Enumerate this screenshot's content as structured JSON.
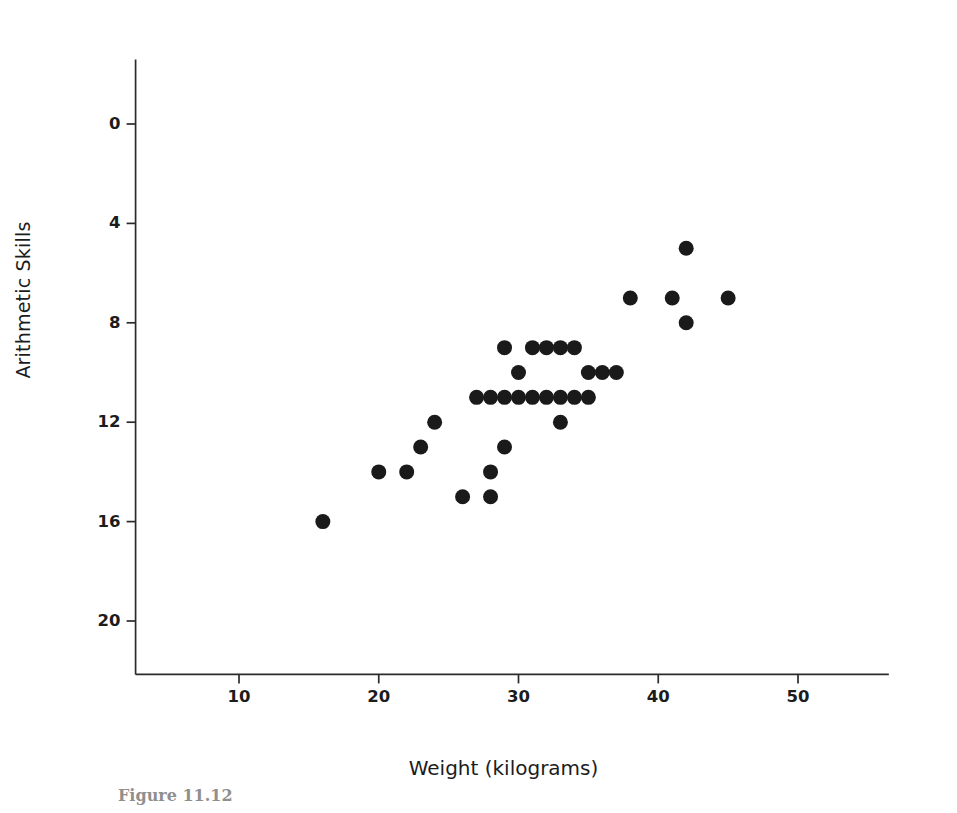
{
  "figure": {
    "caption": "Figure 11.12"
  },
  "chart_data": {
    "type": "scatter",
    "title": "",
    "xlabel": "Weight (kilograms)",
    "ylabel": "Arithmetic Skills",
    "xlim": [
      0,
      57
    ],
    "ylim": [
      -4,
      23
    ],
    "grid": false,
    "legend": "none",
    "xticks": [
      10,
      20,
      30,
      40,
      50
    ],
    "yticks": [
      0,
      4,
      8,
      12,
      16,
      20
    ],
    "marker": {
      "shape": "circle",
      "color": "#1a1a1a",
      "size_px": 15
    },
    "points": [
      {
        "x": 16,
        "y": 4
      },
      {
        "x": 20,
        "y": 6
      },
      {
        "x": 22,
        "y": 6
      },
      {
        "x": 23,
        "y": 7
      },
      {
        "x": 24,
        "y": 8
      },
      {
        "x": 26,
        "y": 5
      },
      {
        "x": 28,
        "y": 5
      },
      {
        "x": 28,
        "y": 6
      },
      {
        "x": 27,
        "y": 9
      },
      {
        "x": 28,
        "y": 9
      },
      {
        "x": 29,
        "y": 7
      },
      {
        "x": 29,
        "y": 11
      },
      {
        "x": 29,
        "y": 9
      },
      {
        "x": 30,
        "y": 9
      },
      {
        "x": 30,
        "y": 10
      },
      {
        "x": 31,
        "y": 9
      },
      {
        "x": 31,
        "y": 11
      },
      {
        "x": 32,
        "y": 9
      },
      {
        "x": 32,
        "y": 11
      },
      {
        "x": 33,
        "y": 8
      },
      {
        "x": 33,
        "y": 9
      },
      {
        "x": 33,
        "y": 11
      },
      {
        "x": 34,
        "y": 9
      },
      {
        "x": 34,
        "y": 11
      },
      {
        "x": 35,
        "y": 9
      },
      {
        "x": 35,
        "y": 10
      },
      {
        "x": 36,
        "y": 10
      },
      {
        "x": 37,
        "y": 10
      },
      {
        "x": 38,
        "y": 13
      },
      {
        "x": 41,
        "y": 13
      },
      {
        "x": 42,
        "y": 15
      },
      {
        "x": 42,
        "y": 12
      },
      {
        "x": 45,
        "y": 13
      }
    ]
  },
  "axes": {
    "y_tick_labels": [
      "20",
      "16",
      "12",
      "8",
      "4",
      "0"
    ],
    "x_tick_labels": [
      "10",
      "20",
      "30",
      "40",
      "50"
    ]
  }
}
